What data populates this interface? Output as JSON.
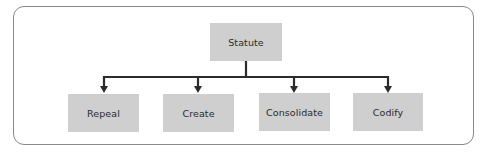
{
  "diagram": {
    "root": {
      "label": "Statute"
    },
    "children": [
      {
        "label": "Repeal"
      },
      {
        "label": "Create"
      },
      {
        "label": "Consolidate"
      },
      {
        "label": "Codify"
      }
    ],
    "colors": {
      "node_fill": "#cfcfcf",
      "connector": "#2b2b2b",
      "frame": "#8a8a8a"
    }
  }
}
